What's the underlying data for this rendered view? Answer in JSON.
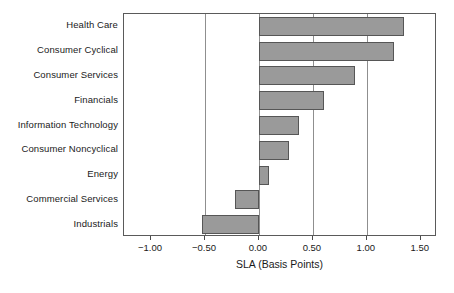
{
  "chart_data": {
    "type": "bar",
    "orientation": "horizontal",
    "title": "",
    "xlabel": "SLA (Basis Points)",
    "ylabel": "",
    "categories": [
      "Health Care",
      "Consumer Cyclical",
      "Consumer Services",
      "Financials",
      "Information Technology",
      "Consumer Noncyclical",
      "Energy",
      "Commercial Services",
      "Industrials"
    ],
    "values": [
      1.34,
      1.25,
      0.89,
      0.6,
      0.37,
      0.28,
      0.09,
      -0.22,
      -0.53
    ],
    "xlim": [
      -1.25,
      1.65
    ],
    "xticks": [
      -1.0,
      -0.5,
      0.0,
      0.5,
      1.0,
      1.5
    ],
    "xtick_labels": [
      "−1.00",
      "−0.50",
      "0.00",
      "0.50",
      "1.00",
      "1.50"
    ],
    "gridlines": [
      -0.5,
      0.0,
      0.5,
      1.0
    ],
    "grid": true,
    "legend": null,
    "bar_fill_color": "#9a9a9a",
    "bar_border_color": "#565656",
    "gridline_color": "#8f8f8f",
    "plot_border_color": "#5a5a5a",
    "background_color": "#ffffff"
  }
}
